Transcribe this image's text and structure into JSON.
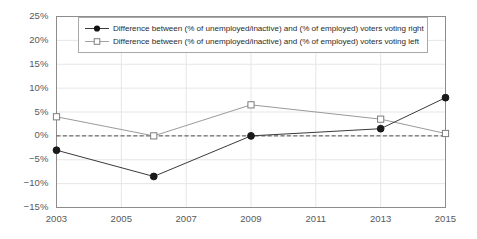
{
  "chart_data": {
    "type": "line",
    "title": "",
    "subtitle": "",
    "xlabel": "",
    "ylabel": "",
    "x": [
      2003,
      2006,
      2009,
      2013,
      2015
    ],
    "xlim": [
      2003,
      2015
    ],
    "ylim": [
      -15,
      25
    ],
    "ytick_values": [
      25,
      20,
      15,
      10,
      5,
      0,
      -5,
      -10,
      -15
    ],
    "ytick_labels": [
      "25%",
      "20%",
      "15%",
      "10%",
      "5%",
      "0%",
      "−5%",
      "−10%",
      "−15%"
    ],
    "xtick_values": [
      2003,
      2005,
      2007,
      2009,
      2011,
      2013,
      2015
    ],
    "xtick_labels": [
      "2003",
      "2005",
      "2007",
      "2009",
      "2011",
      "2013",
      "2015"
    ],
    "grid": true,
    "grid_axis": "both",
    "legend_position": "top-center",
    "zero_reference_line": 0,
    "series": [
      {
        "name": "Difference between (% of unemployed/inactive) and (% of employed) voters voting right",
        "marker": "filled-circle",
        "color": "#1a1a1a",
        "line_color": "#3a3a3a",
        "values": [
          -3,
          -8.5,
          0,
          1.5,
          8
        ]
      },
      {
        "name": "Difference between (% of unemployed/inactive) and (% of employed) voters voting left",
        "marker": "open-square",
        "color": "#ffffff",
        "line_color": "#9a9a9a",
        "values": [
          4,
          0,
          6.5,
          3.5,
          0.5
        ]
      }
    ]
  },
  "colors": {
    "axis": "#8c8c8c",
    "grid": "#e6e6e6",
    "tick_text": "#58595b",
    "legend_border": "#a8a8a8",
    "legend_text": "#2b2b2b",
    "zero_line": "#4a4a4a",
    "background": "#ffffff"
  }
}
